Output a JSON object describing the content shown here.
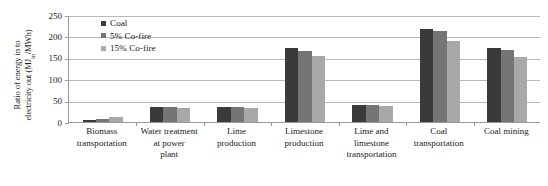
{
  "chart_data": {
    "type": "bar",
    "title": "",
    "xlabel": "",
    "ylabel": "Ratio of energy in to electricity out (MJin/MWh)",
    "ylabel_main": "Ratio of energy in to",
    "ylabel_second": "electricity out (MJ",
    "ylabel_sub": "in",
    "ylabel_tail": "/MWh)",
    "ylim": [
      0,
      250
    ],
    "yticks": [
      250,
      200,
      150,
      100,
      50,
      0
    ],
    "grid": true,
    "legend_position": "top-left-inside",
    "categories": [
      "Biomass transportation",
      "Water treatment at power plant",
      "Lime production",
      "Limestone production",
      "Lime and limestone transportation",
      "Coal transportation",
      "Coal mining"
    ],
    "category_lines": [
      [
        "Biomass",
        "transportation"
      ],
      [
        "Water treatment",
        "at power",
        "plant"
      ],
      [
        "Lime",
        "production"
      ],
      [
        "Limestone",
        "production"
      ],
      [
        "Lime and",
        "limestone",
        "transportation"
      ],
      [
        "Coal",
        "transportation"
      ],
      [
        "Coal mining"
      ]
    ],
    "series": [
      {
        "name": "Coal",
        "color": "#3a3a3a",
        "values": [
          5,
          35,
          35,
          173,
          40,
          218,
          173
        ]
      },
      {
        "name": "5% Co-fire",
        "color": "#757575",
        "values": [
          8,
          34,
          34,
          167,
          39,
          212,
          168
        ]
      },
      {
        "name": "15% Co-fire",
        "color": "#a8a8a8",
        "values": [
          12,
          33,
          33,
          155,
          37,
          190,
          152
        ]
      }
    ]
  }
}
